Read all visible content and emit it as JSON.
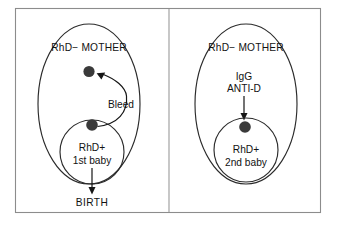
{
  "figure": {
    "background_color": "#ffffff",
    "frame_color": "#8c8c8c",
    "outline_color": "#2b2b2b",
    "dot_color": "#3a3a3a",
    "arrow_color": "#151515",
    "text_color": "#121212"
  },
  "panels": [
    {
      "id": "first-pregnancy",
      "mother_label": "RhD− MOTHER",
      "baby_label_line1": "RhD+",
      "baby_label_line2": "1st baby",
      "flow_label": "Bleed",
      "outcome_label": "BIRTH",
      "maternal_dot": "present",
      "fetal_dot": "present"
    },
    {
      "id": "second-pregnancy",
      "mother_label": "RhD− MOTHER",
      "baby_label_line1": "RhD+",
      "baby_label_line2": "2nd baby",
      "flow_label_line1": "IgG",
      "flow_label_line2": "ANTI-D",
      "outcome_label": "",
      "maternal_dot": "absent",
      "fetal_dot": "present"
    }
  ]
}
